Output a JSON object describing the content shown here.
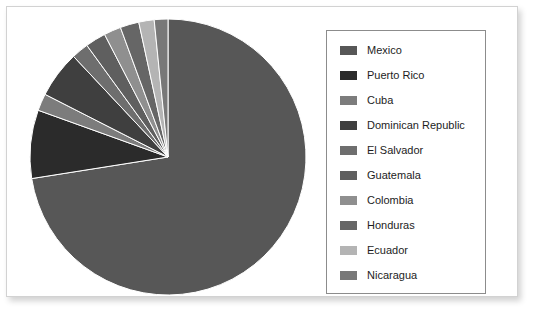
{
  "chart_data": {
    "type": "pie",
    "title": "",
    "legend_position": "right",
    "categories": [
      "Mexico",
      "Puerto Rico",
      "Cuba",
      "Dominican Republic",
      "El Salvador",
      "Guatemala",
      "Colombia",
      "Honduras",
      "Ecuador",
      "Nicaragua"
    ],
    "values": [
      72.5,
      8.0,
      2.0,
      5.5,
      2.0,
      2.4,
      2.0,
      2.2,
      1.8,
      1.6
    ],
    "unit": "percent",
    "colors": [
      "#575757",
      "#2b2b2b",
      "#7c7c7c",
      "#3f3f3f",
      "#6e6e6e",
      "#5f5f5f",
      "#8f8f8f",
      "#666666",
      "#b4b4b4",
      "#787878"
    ],
    "start_angle_deg": 0,
    "direction": "clockwise"
  },
  "legend": {
    "items": [
      {
        "label": "Mexico",
        "color": "#575757"
      },
      {
        "label": "Puerto Rico",
        "color": "#2b2b2b"
      },
      {
        "label": "Cuba",
        "color": "#7c7c7c"
      },
      {
        "label": "Dominican Republic",
        "color": "#3f3f3f"
      },
      {
        "label": "El Salvador",
        "color": "#6e6e6e"
      },
      {
        "label": "Guatemala",
        "color": "#5f5f5f"
      },
      {
        "label": "Colombia",
        "color": "#8f8f8f"
      },
      {
        "label": "Honduras",
        "color": "#666666"
      },
      {
        "label": "Ecuador",
        "color": "#b4b4b4"
      },
      {
        "label": "Nicaragua",
        "color": "#787878"
      }
    ]
  },
  "panel": {
    "border_color": "#d2d2d2",
    "background": "#ffffff"
  }
}
